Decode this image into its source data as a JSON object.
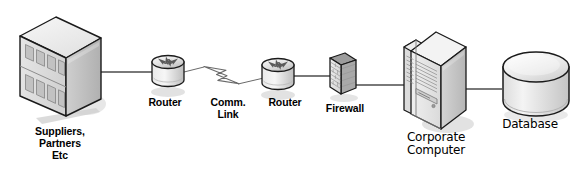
{
  "diagram": {
    "type": "network-topology",
    "canvas": {
      "width": 574,
      "height": 181,
      "background": "#ffffff"
    },
    "palette": {
      "outline": "#1a1a1a",
      "link_line": "#4d4d4d",
      "face_light": "#f2f2f2",
      "face_mid": "#dcdcdc",
      "face_dark": "#b3b3b3",
      "face_darker": "#9a9a9a",
      "shadow": "#cfcfcf",
      "window_fill": "#c8c8c8",
      "text": "#000000"
    },
    "nodes": [
      {
        "id": "suppliers",
        "icon": "office-building-icon",
        "label": "Suppliers,\nPartners\nEtc",
        "label_style": "bold",
        "label_x": 15,
        "label_y": 126,
        "label_w": 90
      },
      {
        "id": "router-left",
        "icon": "router-icon",
        "label": "Router",
        "label_style": "bold",
        "label_x": 133,
        "label_y": 97,
        "label_w": 64
      },
      {
        "id": "comm-link",
        "icon": "lightning-bolt-icon",
        "label": "Comm.\nLink",
        "label_style": "bold",
        "label_x": 199,
        "label_y": 97,
        "label_w": 58
      },
      {
        "id": "router-right",
        "icon": "router-icon",
        "label": "Router",
        "label_style": "bold",
        "label_x": 253,
        "label_y": 97,
        "label_w": 64
      },
      {
        "id": "firewall",
        "icon": "firewall-brick-icon",
        "label": "Firewall",
        "label_style": "bold",
        "label_x": 312,
        "label_y": 103,
        "label_w": 66
      },
      {
        "id": "corporate-computer",
        "icon": "server-tower-icon",
        "label": "Corporate\nComputer",
        "label_style": "plain",
        "label_x": 388,
        "label_y": 131,
        "label_w": 96
      },
      {
        "id": "database",
        "icon": "database-cylinder-icon",
        "label": "Database",
        "label_style": "plain",
        "label_x": 490,
        "label_y": 118,
        "label_w": 80
      }
    ],
    "links": [
      {
        "id": "link-suppliers-router-left",
        "from": "suppliers",
        "to": "router-left",
        "style": "solid"
      },
      {
        "id": "link-router-left-comm",
        "from": "router-left",
        "to": "comm-link",
        "style": "solid"
      },
      {
        "id": "link-comm-router-right",
        "from": "comm-link",
        "to": "router-right",
        "style": "solid"
      },
      {
        "id": "link-router-right-firewall",
        "from": "router-right",
        "to": "firewall",
        "style": "solid"
      },
      {
        "id": "link-firewall-computer",
        "from": "firewall",
        "to": "corporate-computer",
        "style": "solid"
      },
      {
        "id": "link-computer-database",
        "from": "corporate-computer",
        "to": "database",
        "style": "solid"
      }
    ]
  }
}
